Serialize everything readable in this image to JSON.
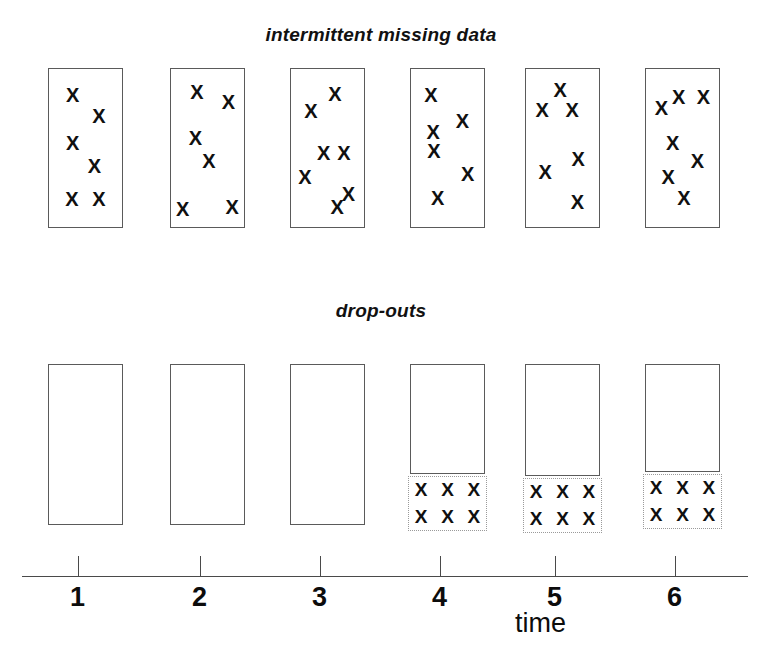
{
  "figure": {
    "panels": [
      {
        "id": "intermittent",
        "title": "intermittent missing data",
        "box_type": "solid",
        "columns": [
          {
            "time": "1",
            "x_count": 5,
            "marks": [
              [
                0.33,
                0.17
              ],
              [
                0.68,
                0.3
              ],
              [
                0.33,
                0.47
              ],
              [
                0.62,
                0.61
              ],
              [
                0.32,
                0.82
              ],
              [
                0.68,
                0.82
              ]
            ]
          },
          {
            "time": "2",
            "x_count": 6,
            "marks": [
              [
                0.36,
                0.15
              ],
              [
                0.78,
                0.21
              ],
              [
                0.34,
                0.44
              ],
              [
                0.52,
                0.58
              ],
              [
                0.17,
                0.88
              ],
              [
                0.83,
                0.87
              ]
            ]
          },
          {
            "time": "3",
            "x_count": 7,
            "marks": [
              [
                0.6,
                0.16
              ],
              [
                0.28,
                0.27
              ],
              [
                0.45,
                0.53
              ],
              [
                0.72,
                0.53
              ],
              [
                0.2,
                0.68
              ],
              [
                0.78,
                0.79
              ],
              [
                0.63,
                0.87
              ]
            ]
          },
          {
            "time": "4",
            "x_count": 6,
            "marks": [
              [
                0.28,
                0.17
              ],
              [
                0.7,
                0.33
              ],
              [
                0.31,
                0.4
              ],
              [
                0.32,
                0.52
              ],
              [
                0.77,
                0.66
              ],
              [
                0.37,
                0.81
              ]
            ]
          },
          {
            "time": "5",
            "x_count": 6,
            "marks": [
              [
                0.47,
                0.14
              ],
              [
                0.23,
                0.26
              ],
              [
                0.63,
                0.26
              ],
              [
                0.71,
                0.57
              ],
              [
                0.27,
                0.65
              ],
              [
                0.7,
                0.84
              ]
            ]
          },
          {
            "time": "6",
            "x_count": 7,
            "marks": [
              [
                0.45,
                0.18
              ],
              [
                0.78,
                0.18
              ],
              [
                0.22,
                0.25
              ],
              [
                0.37,
                0.47
              ],
              [
                0.7,
                0.58
              ],
              [
                0.31,
                0.68
              ],
              [
                0.52,
                0.81
              ]
            ]
          }
        ]
      },
      {
        "id": "dropouts",
        "title": "drop-outs",
        "columns": [
          {
            "time": "1",
            "observed": true,
            "dropped": false,
            "dropout_marks": 0
          },
          {
            "time": "2",
            "observed": true,
            "dropped": false,
            "dropout_marks": 0
          },
          {
            "time": "3",
            "observed": true,
            "dropped": false,
            "dropout_marks": 0
          },
          {
            "time": "4",
            "observed": true,
            "dropped": true,
            "dropout_marks": 6
          },
          {
            "time": "5",
            "observed": true,
            "dropped": true,
            "dropout_marks": 6
          },
          {
            "time": "6",
            "observed": true,
            "dropped": true,
            "dropout_marks": 6
          }
        ]
      }
    ],
    "axis": {
      "label": "time",
      "ticks": [
        "1",
        "2",
        "3",
        "4",
        "5",
        "6"
      ]
    },
    "mark_glyph": "X",
    "colors": {
      "ink": "#101010",
      "box_stroke": "#5a5a5a",
      "dotted_stroke": "#9a9a9a",
      "axis": "#4a4a4a",
      "background": "#ffffff"
    }
  }
}
